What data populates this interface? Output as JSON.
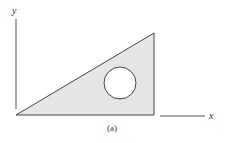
{
  "figure": {
    "caption": "(a)",
    "x_axis_label": "x",
    "y_axis_label": "y",
    "shape": "right triangle with circular hole",
    "colors": {
      "fill": "#e6e6e6",
      "stroke": "#444444",
      "hole": "#ffffff",
      "axis": "#555555"
    }
  }
}
